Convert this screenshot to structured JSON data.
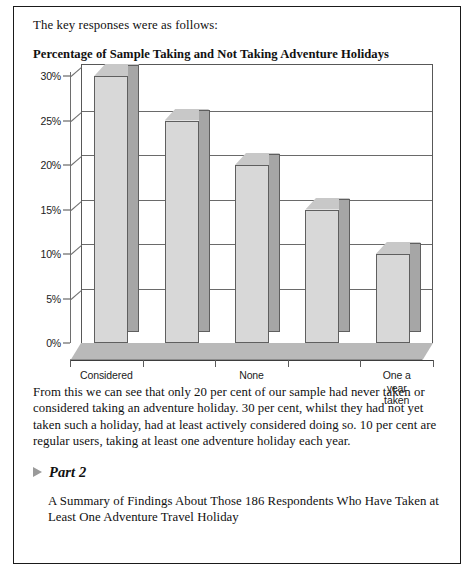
{
  "document": {
    "intro_text": "The key responses were as follows:",
    "chart_title": "Percentage of Sample Taking and Not Taking Adventure Holidays",
    "paragraph": "From this we can see that only 20 per cent of our sample had never taken or considered taking an adventure holiday. 30 per cent, whilst they had not yet taken such a holiday, had at least actively considered doing so. 10 per cent are regular users, taking at least one adventure holiday each year.",
    "part_marker_icon": "triangle-right-icon",
    "part_title": "Part 2",
    "part_subtitle": "A Summary of Findings About Those 186 Respondents Who Have Taken at Least One Adventure Travel Holiday"
  },
  "chart_data": {
    "type": "bar",
    "title": "Percentage of Sample Taking and Not Taking Adventure Holidays",
    "xlabel": "",
    "ylabel": "",
    "categories": [
      "Considered",
      "",
      "None",
      "",
      "One a year\ntaken"
    ],
    "visible_tick_labels": [
      "Considered",
      "None",
      "One a year\ntaken"
    ],
    "values": [
      30,
      25,
      20,
      15,
      10
    ],
    "ylim": [
      0,
      30
    ],
    "yticks": [
      0,
      5,
      10,
      15,
      20,
      25,
      30
    ],
    "ytick_labels": [
      "0%",
      "5%",
      "10%",
      "15%",
      "20%",
      "25%",
      "30%"
    ],
    "grid": true,
    "legend": false,
    "style": "3d-column",
    "colors": {
      "bar_front": "#d8d8d8",
      "bar_side": "#a6a6a6",
      "bar_top": "#c8c8c8",
      "floor": "#b9b9b9",
      "axis": "#5a5a5a",
      "gridline": "#6a6a6a"
    }
  }
}
